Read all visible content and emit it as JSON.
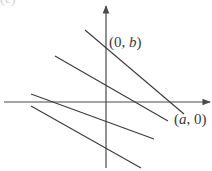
{
  "figure": {
    "top_fragment": "(c)",
    "labels": {
      "y_intercept": {
        "open": "(0, ",
        "var": "b",
        "close": ")"
      },
      "x_intercept": {
        "open": "(",
        "var": "a",
        "close": ", 0)"
      }
    },
    "colors": {
      "line": "#3a3a3a",
      "axis": "#4a4a4a",
      "text": "#3a3a3a"
    },
    "axes": {
      "x_axis": {
        "x1": 4,
        "y1": 102,
        "x2": 210,
        "y2": 102
      },
      "y_axis": {
        "x1": 106,
        "y1": 168,
        "x2": 106,
        "y2": 6
      }
    },
    "lines": [
      {
        "name": "line-through-intercepts",
        "x1": 85,
        "y1": 30,
        "x2": 184,
        "y2": 114
      },
      {
        "name": "parallel-line-2",
        "x1": 55,
        "y1": 56,
        "x2": 168,
        "y2": 121
      },
      {
        "name": "parallel-line-3",
        "x1": 31,
        "y1": 94,
        "x2": 154,
        "y2": 139
      },
      {
        "name": "parallel-line-4",
        "x1": 31,
        "y1": 106,
        "x2": 141,
        "y2": 168
      }
    ]
  }
}
